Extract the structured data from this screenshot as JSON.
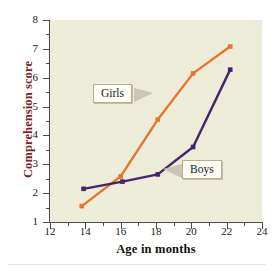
{
  "chart_data": {
    "type": "line",
    "title": "",
    "xlabel": "Age in months",
    "ylabel": "Comprehension score",
    "xlim": [
      12,
      24
    ],
    "ylim": [
      1,
      8
    ],
    "xticks": [
      12,
      14,
      16,
      18,
      20,
      22,
      24
    ],
    "xticks_minor": [
      13,
      15,
      17,
      19,
      21,
      23
    ],
    "yticks": [
      1,
      2,
      3,
      4,
      5,
      6,
      7,
      8
    ],
    "yticks_minor": [
      1.5,
      2.5,
      3.5,
      4.5,
      5.5,
      6.5,
      7.5
    ],
    "grid": false,
    "legend": "annotations",
    "series": [
      {
        "name": "Girls",
        "color": "#e8752e",
        "marker": "square",
        "x": [
          13.8,
          16.0,
          18.1,
          20.1,
          22.2
        ],
        "y": [
          1.55,
          2.58,
          4.55,
          6.15,
          7.08
        ]
      },
      {
        "name": "Boys",
        "color": "#46236d",
        "marker": "square",
        "x": [
          13.9,
          16.1,
          18.1,
          20.1,
          22.2
        ],
        "y": [
          2.15,
          2.4,
          2.65,
          3.6,
          6.28
        ]
      }
    ],
    "annotations": [
      {
        "text": "Girls",
        "points_to": "girls-line",
        "direction": "right"
      },
      {
        "text": "Boys",
        "points_to": "boys-line",
        "direction": "left"
      }
    ]
  },
  "axes": {
    "x_title": "Age in months",
    "y_title": "Comprehension score",
    "x_tick_labels": [
      "12",
      "14",
      "16",
      "18",
      "20",
      "22",
      "24"
    ],
    "y_tick_labels": [
      "1",
      "2",
      "3",
      "4",
      "5",
      "6",
      "7",
      "8"
    ]
  },
  "labels": {
    "girls": "Girls",
    "boys": "Boys"
  },
  "colors": {
    "plot_background": "#edecd8",
    "girls_line": "#e8752e",
    "boys_line": "#46236d",
    "y_title": "#7b1f2b",
    "axis": "#4d4d4d"
  }
}
